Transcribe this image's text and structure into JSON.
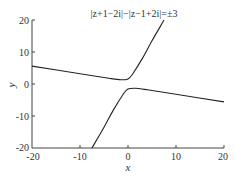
{
  "chart_data": {
    "type": "line",
    "title": "|z+1−2i|−|z−1+2i|=±3",
    "xlabel": "x",
    "ylabel": "y",
    "xlim": [
      -20,
      20
    ],
    "ylim": [
      -20,
      20
    ],
    "xticks": [
      "-20",
      "-10",
      "0",
      "10",
      "20"
    ],
    "yticks": [
      "20",
      "10",
      "0",
      "-10",
      "-20"
    ],
    "grid": false,
    "legend": null,
    "series": [
      {
        "name": "upper branch",
        "points": [
          [
            -20,
            5.6
          ],
          [
            -10,
            3.2
          ],
          [
            -4,
            1.8
          ],
          [
            -1.5,
            1.3
          ],
          [
            0,
            1.6
          ],
          [
            1,
            3.2
          ],
          [
            3,
            8
          ],
          [
            5,
            13.5
          ],
          [
            7.5,
            20
          ]
        ]
      },
      {
        "name": "lower branch",
        "points": [
          [
            -7.5,
            -20
          ],
          [
            -5,
            -13.5
          ],
          [
            -3,
            -8
          ],
          [
            -1,
            -3.2
          ],
          [
            0,
            -1.6
          ],
          [
            1.5,
            -1.3
          ],
          [
            4,
            -1.8
          ],
          [
            10,
            -3.2
          ],
          [
            20,
            -5.6
          ]
        ]
      }
    ]
  }
}
